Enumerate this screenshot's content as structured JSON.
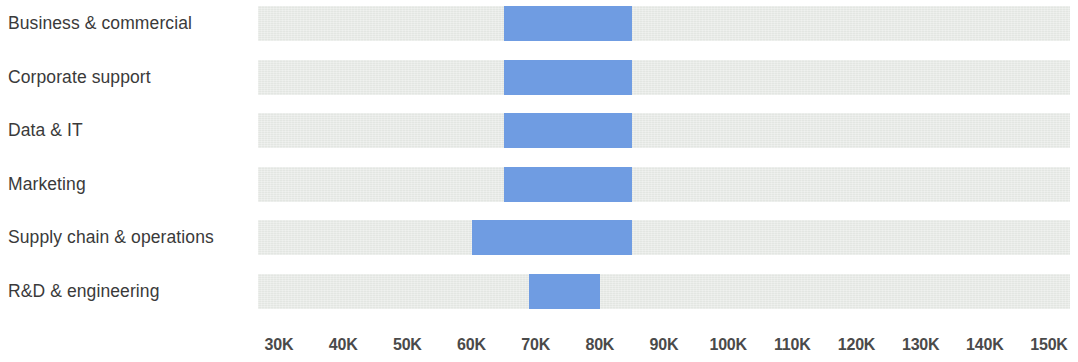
{
  "chart_data": {
    "type": "bar",
    "subtype": "range",
    "title": "",
    "subtitle": "",
    "xlabel": "",
    "ylabel": "",
    "xlim": [
      25000,
      155000
    ],
    "grid": false,
    "legend": null,
    "tick_labels": [
      "30K",
      "40K",
      "50K",
      "60K",
      "70K",
      "80K",
      "90K",
      "100K",
      "110K",
      "120K",
      "130K",
      "140K",
      "150K"
    ],
    "tick_values": [
      30000,
      40000,
      50000,
      60000,
      70000,
      80000,
      90000,
      100000,
      110000,
      120000,
      130000,
      140000,
      150000
    ],
    "categories": [
      "Business & commercial",
      "Corporate support",
      "Data & IT",
      "Marketing",
      "Supply chain & operations",
      "R&D & engineering"
    ],
    "series": [
      {
        "name": "Salary range",
        "values": [
          {
            "category": "Business & commercial",
            "low": 65000,
            "high": 85000
          },
          {
            "category": "Corporate support",
            "low": 65000,
            "high": 85000
          },
          {
            "category": "Data & IT",
            "low": 65000,
            "high": 85000
          },
          {
            "category": "Marketing",
            "low": 65000,
            "high": 85000
          },
          {
            "category": "Supply chain & operations",
            "low": 60000,
            "high": 85000
          },
          {
            "category": "R&D & engineering",
            "low": 69000,
            "high": 80000
          }
        ]
      }
    ],
    "colors": {
      "bar": "#6f9ce2",
      "track": "#e3e6e2",
      "label_text": "#3a3a3a",
      "tick_text": "#4a4a4a",
      "background": "#ffffff"
    }
  }
}
